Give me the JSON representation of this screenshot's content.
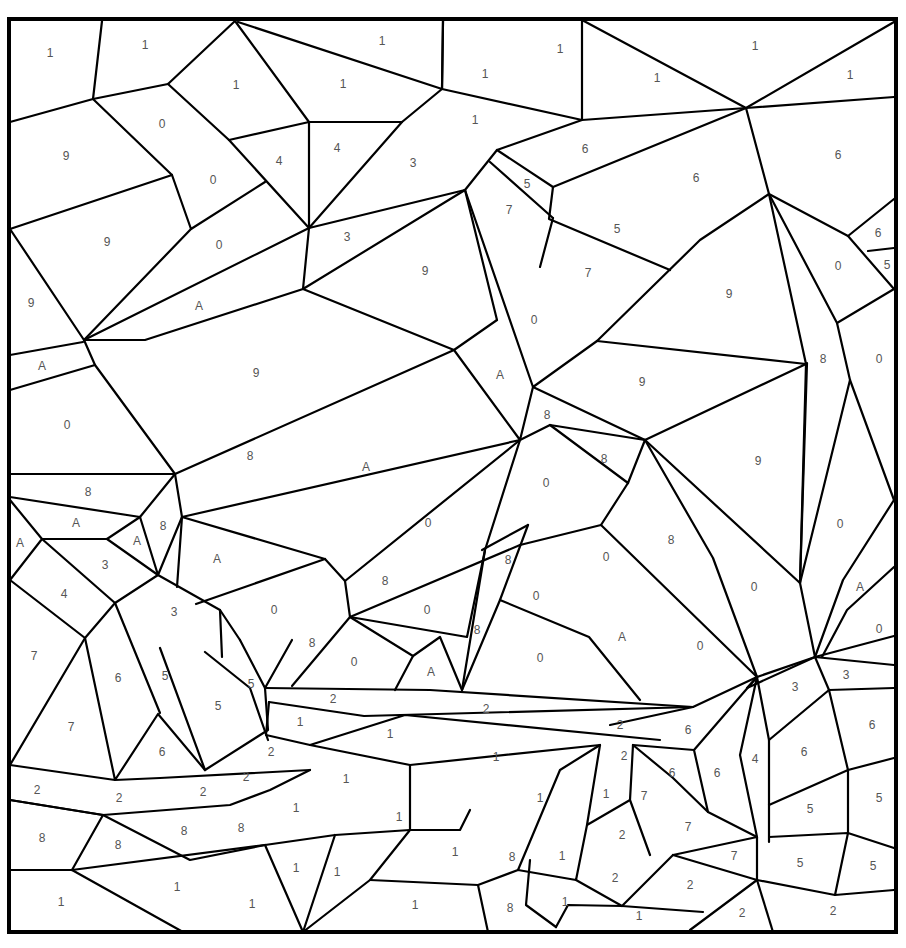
{
  "puzzle": {
    "type": "color-by-number",
    "frame": {
      "x": 9,
      "y": 19,
      "w": 887,
      "h": 913
    },
    "line_color": "#000000",
    "label_color": "#555555",
    "labels": [
      {
        "t": "1",
        "x": 50,
        "y": 53
      },
      {
        "t": "1",
        "x": 145,
        "y": 45
      },
      {
        "t": "1",
        "x": 236,
        "y": 85
      },
      {
        "t": "1",
        "x": 343,
        "y": 84
      },
      {
        "t": "1",
        "x": 382,
        "y": 41
      },
      {
        "t": "1",
        "x": 485,
        "y": 74
      },
      {
        "t": "1",
        "x": 560,
        "y": 49
      },
      {
        "t": "1",
        "x": 657,
        "y": 78
      },
      {
        "t": "1",
        "x": 755,
        "y": 46
      },
      {
        "t": "1",
        "x": 850,
        "y": 75
      },
      {
        "t": "1",
        "x": 475,
        "y": 120
      },
      {
        "t": "9",
        "x": 66,
        "y": 156
      },
      {
        "t": "0",
        "x": 162,
        "y": 124
      },
      {
        "t": "0",
        "x": 213,
        "y": 180
      },
      {
        "t": "4",
        "x": 279,
        "y": 161
      },
      {
        "t": "4",
        "x": 337,
        "y": 148
      },
      {
        "t": "3",
        "x": 413,
        "y": 163
      },
      {
        "t": "6",
        "x": 585,
        "y": 149
      },
      {
        "t": "6",
        "x": 696,
        "y": 178
      },
      {
        "t": "6",
        "x": 838,
        "y": 155
      },
      {
        "t": "5",
        "x": 527,
        "y": 184
      },
      {
        "t": "7",
        "x": 509,
        "y": 210
      },
      {
        "t": "5",
        "x": 617,
        "y": 229
      },
      {
        "t": "7",
        "x": 588,
        "y": 273
      },
      {
        "t": "6",
        "x": 878,
        "y": 233
      },
      {
        "t": "5",
        "x": 887,
        "y": 265
      },
      {
        "t": "0",
        "x": 838,
        "y": 266
      },
      {
        "t": "9",
        "x": 107,
        "y": 242
      },
      {
        "t": "0",
        "x": 219,
        "y": 245
      },
      {
        "t": "3",
        "x": 347,
        "y": 237
      },
      {
        "t": "9",
        "x": 425,
        "y": 271
      },
      {
        "t": "9",
        "x": 31,
        "y": 303
      },
      {
        "t": "A",
        "x": 199,
        "y": 306
      },
      {
        "t": "9",
        "x": 729,
        "y": 294
      },
      {
        "t": "0",
        "x": 534,
        "y": 320
      },
      {
        "t": "A",
        "x": 42,
        "y": 366
      },
      {
        "t": "9",
        "x": 256,
        "y": 373
      },
      {
        "t": "A",
        "x": 500,
        "y": 375
      },
      {
        "t": "9",
        "x": 642,
        "y": 382
      },
      {
        "t": "8",
        "x": 823,
        "y": 359
      },
      {
        "t": "0",
        "x": 879,
        "y": 359
      },
      {
        "t": "0",
        "x": 67,
        "y": 425
      },
      {
        "t": "8",
        "x": 547,
        "y": 415
      },
      {
        "t": "8",
        "x": 250,
        "y": 456
      },
      {
        "t": "A",
        "x": 366,
        "y": 467
      },
      {
        "t": "8",
        "x": 604,
        "y": 459
      },
      {
        "t": "9",
        "x": 758,
        "y": 461
      },
      {
        "t": "8",
        "x": 88,
        "y": 492
      },
      {
        "t": "0",
        "x": 546,
        "y": 483
      },
      {
        "t": "A",
        "x": 76,
        "y": 523
      },
      {
        "t": "8",
        "x": 163,
        "y": 526
      },
      {
        "t": "0",
        "x": 428,
        "y": 523
      },
      {
        "t": "0",
        "x": 840,
        "y": 524
      },
      {
        "t": "A",
        "x": 20,
        "y": 543
      },
      {
        "t": "A",
        "x": 137,
        "y": 541
      },
      {
        "t": "8",
        "x": 671,
        "y": 540
      },
      {
        "t": "A",
        "x": 217,
        "y": 559
      },
      {
        "t": "0",
        "x": 606,
        "y": 557
      },
      {
        "t": "3",
        "x": 105,
        "y": 565
      },
      {
        "t": "8",
        "x": 508,
        "y": 560
      },
      {
        "t": "8",
        "x": 385,
        "y": 581
      },
      {
        "t": "0",
        "x": 754,
        "y": 587
      },
      {
        "t": "A",
        "x": 860,
        "y": 587
      },
      {
        "t": "4",
        "x": 64,
        "y": 594
      },
      {
        "t": "0",
        "x": 536,
        "y": 596
      },
      {
        "t": "3",
        "x": 174,
        "y": 612
      },
      {
        "t": "0",
        "x": 274,
        "y": 610
      },
      {
        "t": "0",
        "x": 427,
        "y": 610
      },
      {
        "t": "8",
        "x": 477,
        "y": 630
      },
      {
        "t": "A",
        "x": 622,
        "y": 637
      },
      {
        "t": "0",
        "x": 879,
        "y": 629
      },
      {
        "t": "8",
        "x": 312,
        "y": 643
      },
      {
        "t": "0",
        "x": 700,
        "y": 646
      },
      {
        "t": "7",
        "x": 34,
        "y": 656
      },
      {
        "t": "0",
        "x": 540,
        "y": 658
      },
      {
        "t": "0",
        "x": 354,
        "y": 662
      },
      {
        "t": "A",
        "x": 431,
        "y": 672
      },
      {
        "t": "6",
        "x": 118,
        "y": 678
      },
      {
        "t": "5",
        "x": 165,
        "y": 676
      },
      {
        "t": "3",
        "x": 846,
        "y": 675
      },
      {
        "t": "5",
        "x": 251,
        "y": 684
      },
      {
        "t": "3",
        "x": 795,
        "y": 687
      },
      {
        "t": "2",
        "x": 333,
        "y": 699
      },
      {
        "t": "5",
        "x": 218,
        "y": 706
      },
      {
        "t": "2",
        "x": 486,
        "y": 709
      },
      {
        "t": "1",
        "x": 300,
        "y": 722
      },
      {
        "t": "2",
        "x": 620,
        "y": 725
      },
      {
        "t": "7",
        "x": 71,
        "y": 727
      },
      {
        "t": "6",
        "x": 688,
        "y": 730
      },
      {
        "t": "1",
        "x": 390,
        "y": 734
      },
      {
        "t": "6",
        "x": 872,
        "y": 725
      },
      {
        "t": "6",
        "x": 162,
        "y": 752
      },
      {
        "t": "2",
        "x": 271,
        "y": 752
      },
      {
        "t": "2",
        "x": 624,
        "y": 756
      },
      {
        "t": "1",
        "x": 496,
        "y": 757
      },
      {
        "t": "4",
        "x": 755,
        "y": 759
      },
      {
        "t": "6",
        "x": 804,
        "y": 752
      },
      {
        "t": "2",
        "x": 246,
        "y": 777
      },
      {
        "t": "6",
        "x": 672,
        "y": 773
      },
      {
        "t": "6",
        "x": 717,
        "y": 773
      },
      {
        "t": "1",
        "x": 346,
        "y": 779
      },
      {
        "t": "2",
        "x": 37,
        "y": 790
      },
      {
        "t": "2",
        "x": 119,
        "y": 798
      },
      {
        "t": "2",
        "x": 203,
        "y": 792
      },
      {
        "t": "7",
        "x": 644,
        "y": 796
      },
      {
        "t": "1",
        "x": 540,
        "y": 798
      },
      {
        "t": "1",
        "x": 606,
        "y": 794
      },
      {
        "t": "1",
        "x": 296,
        "y": 808
      },
      {
        "t": "5",
        "x": 810,
        "y": 809
      },
      {
        "t": "5",
        "x": 879,
        "y": 798
      },
      {
        "t": "1",
        "x": 399,
        "y": 817
      },
      {
        "t": "8",
        "x": 42,
        "y": 838
      },
      {
        "t": "8",
        "x": 184,
        "y": 831
      },
      {
        "t": "8",
        "x": 241,
        "y": 828
      },
      {
        "t": "2",
        "x": 622,
        "y": 835
      },
      {
        "t": "7",
        "x": 688,
        "y": 827
      },
      {
        "t": "8",
        "x": 118,
        "y": 845
      },
      {
        "t": "1",
        "x": 455,
        "y": 852
      },
      {
        "t": "8",
        "x": 512,
        "y": 857
      },
      {
        "t": "1",
        "x": 562,
        "y": 856
      },
      {
        "t": "7",
        "x": 734,
        "y": 856
      },
      {
        "t": "5",
        "x": 800,
        "y": 863
      },
      {
        "t": "5",
        "x": 873,
        "y": 866
      },
      {
        "t": "1",
        "x": 296,
        "y": 868
      },
      {
        "t": "1",
        "x": 337,
        "y": 872
      },
      {
        "t": "2",
        "x": 615,
        "y": 878
      },
      {
        "t": "2",
        "x": 690,
        "y": 885
      },
      {
        "t": "1",
        "x": 177,
        "y": 887
      },
      {
        "t": "1",
        "x": 61,
        "y": 902
      },
      {
        "t": "1",
        "x": 252,
        "y": 904
      },
      {
        "t": "1",
        "x": 415,
        "y": 905
      },
      {
        "t": "8",
        "x": 510,
        "y": 908
      },
      {
        "t": "1",
        "x": 565,
        "y": 902
      },
      {
        "t": "1",
        "x": 639,
        "y": 916
      },
      {
        "t": "2",
        "x": 742,
        "y": 913
      },
      {
        "t": "2",
        "x": 833,
        "y": 911
      }
    ]
  }
}
